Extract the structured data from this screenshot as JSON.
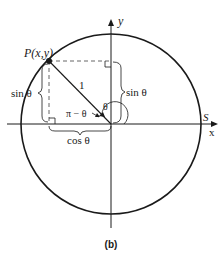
{
  "diagram": {
    "caption": "(b)",
    "point_label": "P(x,y)",
    "radius_label": "1",
    "angle_label": "θ",
    "supplement_label": "π − θ",
    "sin_left_label": "sin θ",
    "sin_right_label": "sin θ",
    "cos_label": "cos θ",
    "x_axis_label": "x",
    "y_axis_label": "y",
    "s_label": "S",
    "colors": {
      "stroke": "#1a1a1a",
      "dashed": "#555555",
      "background": "#ffffff"
    }
  }
}
